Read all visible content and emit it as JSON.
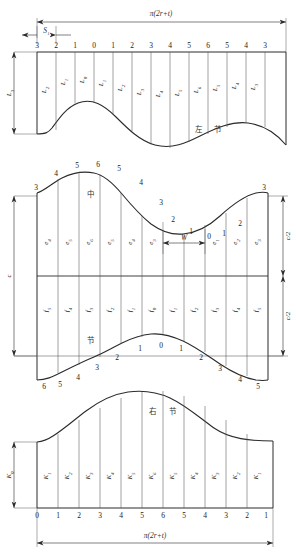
{
  "drawing": {
    "title": "Elbow segment development layout",
    "overall_width_label": "π(2r+t)",
    "colors": {
      "line": "#2b2b2b",
      "thin": "#555555",
      "text": "#1a1a1a",
      "background": "#ffffff"
    }
  },
  "panels": [
    {
      "id": "left-section",
      "name": "左 节",
      "cjk_chars": [
        "左",
        "节"
      ],
      "top_dimension": "π(2r+t)",
      "offset_dimension": "S₁",
      "height_dimension": "L₃",
      "top_numbers": [
        "3",
        "2",
        "1",
        "0",
        "1",
        "2",
        "3",
        "4",
        "5",
        "6",
        "5",
        "4",
        "3"
      ],
      "ordinate_labels": [
        "L₃",
        "L₂",
        "L₁",
        "L₀",
        "L₁",
        "L₂",
        "L₃",
        "L₄",
        "L₅",
        "L₆",
        "L₅",
        "L₄",
        "L₃"
      ],
      "ordinate_bases": [
        "L3",
        "L2",
        "L1",
        "L0",
        "L1",
        "L2",
        "L3",
        "L4",
        "L5",
        "L6",
        "L5",
        "L4",
        "L3"
      ],
      "ordinate_subs": [
        "3",
        "2",
        "1",
        "0",
        "1",
        "2",
        "3",
        "4",
        "5",
        "6",
        "5",
        "4",
        "3"
      ]
    },
    {
      "id": "middle-section",
      "name": "中 节",
      "cjk_upper": "中",
      "cjk_lower": "节",
      "height_dimension": "c",
      "half_height_dimension_upper": "c/2",
      "half_height_dimension_lower": "c/2",
      "width_dimension": "W",
      "top_curve_numbers": [
        "3",
        "4",
        "5",
        "6",
        "5",
        "4",
        "3",
        "2",
        "1",
        "0",
        "1",
        "2",
        "3"
      ],
      "bottom_curve_numbers": [
        "6",
        "5",
        "4",
        "3",
        "2",
        "1",
        "0",
        "1",
        "2",
        "3",
        "4",
        "5"
      ],
      "upper_ordinate_subs": [
        "4",
        "5",
        "6",
        "5",
        "4",
        "3",
        "2",
        "1",
        "1",
        "2",
        "3"
      ],
      "upper_ordinate_bases": [
        "e",
        "e",
        "e",
        "e",
        "e",
        "e",
        "e",
        "e",
        "e",
        "e",
        "e"
      ],
      "lower_ordinate_subs": [
        "5",
        "4",
        "3",
        "2",
        "1",
        "0",
        "1",
        "2",
        "3",
        "4",
        "5"
      ],
      "lower_ordinate_bases": [
        "f",
        "f",
        "f",
        "f",
        "f",
        "f",
        "f",
        "f",
        "f",
        "f",
        "f"
      ]
    },
    {
      "id": "right-section",
      "name": "右 节",
      "cjk_chars": [
        "右",
        "节"
      ],
      "bottom_dimension": "π(2r+t)",
      "height_dimension": "K₀",
      "bottom_numbers": [
        "0",
        "1",
        "2",
        "3",
        "4",
        "5",
        "6",
        "5",
        "4",
        "3",
        "2",
        "1"
      ],
      "ordinate_subs": [
        "1",
        "2",
        "3",
        "4",
        "5",
        "6",
        "5",
        "4",
        "3",
        "2",
        "1"
      ],
      "ordinate_bases": [
        "K",
        "K",
        "K",
        "K",
        "K",
        "K",
        "K",
        "K",
        "K",
        "K",
        "K"
      ]
    }
  ]
}
